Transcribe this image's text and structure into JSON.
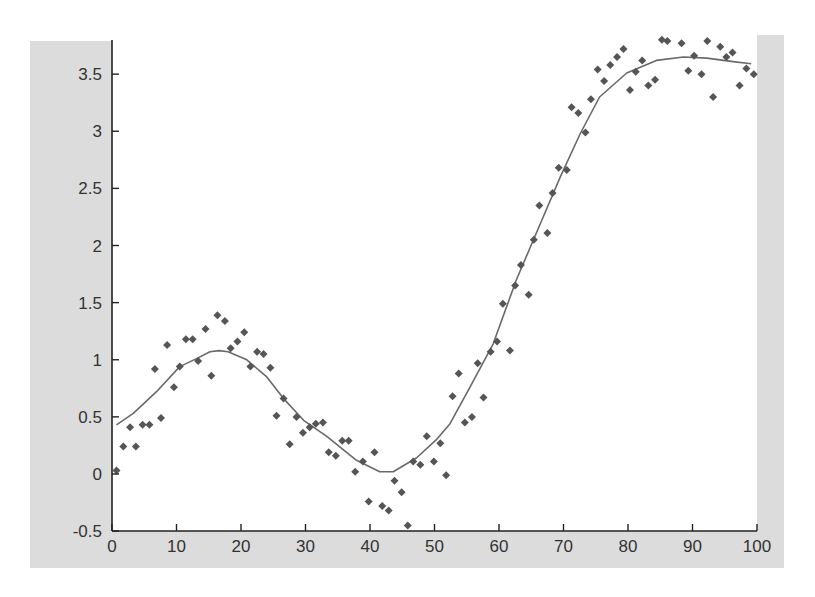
{
  "chart_data": {
    "type": "scatter",
    "title": "",
    "xlabel": "",
    "ylabel": "",
    "xlim": [
      0,
      100
    ],
    "ylim": [
      -0.5,
      3.75
    ],
    "grid": false,
    "legend": null,
    "x_ticks": [
      0,
      10,
      20,
      30,
      40,
      50,
      60,
      70,
      80,
      90,
      100
    ],
    "x_tick_labels": [
      "0",
      "10",
      "20",
      "30",
      "40",
      "50",
      "60",
      "70",
      "80",
      "90",
      "100"
    ],
    "y_ticks": [
      -0.5,
      0,
      0.5,
      1,
      1.5,
      2,
      2.5,
      3,
      3.5
    ],
    "y_tick_labels": [
      "-0.5",
      "0",
      "0.5",
      "1",
      "1.5",
      "2",
      "2.5",
      "3",
      "3.5"
    ],
    "series": [
      {
        "name": "data points",
        "style": "diamond-markers",
        "color": "#555555",
        "x": [
          0.7,
          1.75,
          2.8,
          3.7,
          4.75,
          5.8,
          6.65,
          7.6,
          8.55,
          9.6,
          10.5,
          11.45,
          12.5,
          13.35,
          14.5,
          15.4,
          16.35,
          17.5,
          18.4,
          19.45,
          20.5,
          21.45,
          22.5,
          23.5,
          24.55,
          25.5,
          26.6,
          27.55,
          28.6,
          29.6,
          30.65,
          31.6,
          32.7,
          33.6,
          34.7,
          35.7,
          36.7,
          37.7,
          38.9,
          39.8,
          40.7,
          41.9,
          42.9,
          43.8,
          44.9,
          45.85,
          46.7,
          47.8,
          48.8,
          49.9,
          50.9,
          51.8,
          52.8,
          53.75,
          54.7,
          55.8,
          56.7,
          57.6,
          58.7,
          59.7,
          60.6,
          61.7,
          62.5,
          63.4,
          64.6,
          65.4,
          66.25,
          67.5,
          68.3,
          69.25,
          70.5,
          71.25,
          72.3,
          73.4,
          74.25,
          75.3,
          76.3,
          77.25,
          78.3,
          79.3,
          80.3,
          81.2,
          82.2,
          83.15,
          84.2,
          85.25,
          86.1,
          88.3,
          89.35,
          90.25,
          91.4,
          92.3,
          93.2,
          94.3,
          95.25,
          96.2,
          97.3,
          98.35,
          99.5
        ],
        "y": [
          0.03,
          0.24,
          0.41,
          0.24,
          0.43,
          0.43,
          0.92,
          0.49,
          1.13,
          0.76,
          0.94,
          1.18,
          1.18,
          0.99,
          1.27,
          0.86,
          1.39,
          1.34,
          1.1,
          1.16,
          1.24,
          0.94,
          1.07,
          1.05,
          0.93,
          0.51,
          0.66,
          0.26,
          0.5,
          0.36,
          0.41,
          0.44,
          0.45,
          0.19,
          0.16,
          0.29,
          0.29,
          0.02,
          0.11,
          -0.24,
          0.19,
          -0.28,
          -0.32,
          -0.06,
          -0.16,
          -0.45,
          0.11,
          0.08,
          0.33,
          0.11,
          0.27,
          -0.01,
          0.68,
          0.88,
          0.45,
          0.5,
          0.97,
          0.67,
          1.07,
          1.16,
          1.49,
          1.08,
          1.65,
          1.83,
          1.57,
          2.05,
          2.35,
          2.11,
          2.46,
          2.68,
          2.66,
          3.21,
          3.16,
          2.99,
          3.28,
          3.54,
          3.44,
          3.58,
          3.65,
          3.72,
          3.36,
          3.52,
          3.62,
          3.4,
          3.45,
          3.8,
          3.79,
          3.77,
          3.53,
          3.66,
          3.5,
          3.79,
          3.3,
          3.74,
          3.65,
          3.69,
          3.4,
          3.55,
          3.5
        ]
      },
      {
        "name": "fitted curve",
        "style": "line",
        "color": "#666666",
        "x": [
          0.7,
          3.3,
          6.9,
          10.5,
          13.1,
          15.2,
          16.6,
          18.0,
          20.9,
          24.0,
          26.6,
          29.7,
          33.3,
          37.9,
          41.5,
          43.6,
          47.2,
          50.3,
          52.4,
          55.5,
          59.1,
          62.7,
          66.4,
          69.5,
          72.6,
          75.6,
          79.8,
          84.4,
          88.6,
          92.2,
          96.3,
          99.1
        ],
        "y": [
          0.43,
          0.53,
          0.72,
          0.94,
          1.01,
          1.07,
          1.08,
          1.07,
          1.0,
          0.85,
          0.66,
          0.47,
          0.33,
          0.12,
          0.02,
          0.02,
          0.14,
          0.3,
          0.44,
          0.76,
          1.14,
          1.7,
          2.19,
          2.6,
          2.98,
          3.3,
          3.51,
          3.62,
          3.65,
          3.64,
          3.61,
          3.59
        ]
      }
    ]
  },
  "colors": {
    "figure_background": "#dcdcdc",
    "axes_background": "#ffffff",
    "axis_line": "#222222",
    "marker": "#555555",
    "curve": "#6a6a6a"
  }
}
